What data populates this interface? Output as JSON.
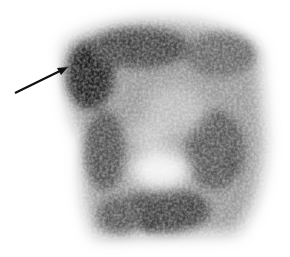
{
  "image": {
    "kind": "grayscale scintigraphy scan",
    "background": "#ffffff",
    "uptake_color": "#1a1a1a",
    "annotation": {
      "type": "arrow",
      "from": [
        15,
        93
      ],
      "to": [
        67,
        68
      ],
      "color": "#111111"
    }
  }
}
